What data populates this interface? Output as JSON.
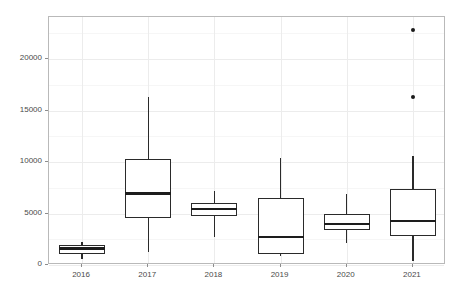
{
  "chart_data": {
    "type": "box",
    "title": "",
    "subtitle": "",
    "xlabel": "",
    "ylabel": "Number of signatures (national projects)",
    "categories": [
      "2016",
      "2017",
      "2018",
      "2019",
      "2020",
      "2021"
    ],
    "ylim": [
      -700,
      23800
    ],
    "yticks": [
      0,
      5000,
      10000,
      15000,
      20000
    ],
    "ytick_labels": [
      "0",
      "5000",
      "10000",
      "15000",
      "20000"
    ],
    "grid": true,
    "legend": "none",
    "boxes": [
      {
        "category": "2016",
        "whisker_low": 600,
        "q1": 1100,
        "median": 1600,
        "q3": 1900,
        "whisker_high": 2200,
        "outliers": []
      },
      {
        "category": "2017",
        "whisker_low": 1250,
        "q1": 4600,
        "median": 6950,
        "q3": 10300,
        "whisker_high": 16300,
        "outliers": []
      },
      {
        "category": "2018",
        "whisker_low": 2750,
        "q1": 4800,
        "median": 5400,
        "q3": 6000,
        "whisker_high": 7200,
        "outliers": []
      },
      {
        "category": "2019",
        "whisker_low": 900,
        "q1": 1050,
        "median": 2700,
        "q3": 6550,
        "whisker_high": 10350,
        "outliers": []
      },
      {
        "category": "2020",
        "whisker_low": 2100,
        "q1": 3350,
        "median": 4000,
        "q3": 4950,
        "whisker_high": 6900,
        "outliers": []
      },
      {
        "category": "2021",
        "whisker_low": 400,
        "q1": 2800,
        "median": 4250,
        "q3": 7400,
        "whisker_high": 10550,
        "outliers": [
          16300,
          22800
        ]
      }
    ],
    "colors": {
      "box_stroke": "#2a2a2a",
      "box_fill": "#ffffff",
      "median": "#1d1d1d",
      "whisker": "#2a2a2a",
      "outlier": "#1a1a1a",
      "panel_border": "#b9b9b9",
      "grid_major": "#ececec",
      "grid_minor": "#f6f6f6",
      "background": "#ffffff",
      "axis_text": "#4a4a4a"
    }
  }
}
